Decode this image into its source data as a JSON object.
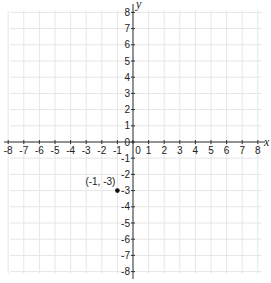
{
  "chart_data": {
    "type": "scatter",
    "title": "",
    "xlabel": "x",
    "ylabel": "y",
    "xlim": [
      -8,
      8
    ],
    "ylim": [
      -8,
      8
    ],
    "grid": true,
    "x_ticks": [
      -8,
      -7,
      -6,
      -5,
      -4,
      -3,
      -2,
      -1,
      0,
      1,
      2,
      3,
      4,
      5,
      6,
      7,
      8
    ],
    "y_ticks": [
      8,
      7,
      6,
      5,
      4,
      3,
      2,
      1,
      0,
      -1,
      -2,
      -3,
      -4,
      -5,
      -6,
      -7,
      -8
    ],
    "points": [
      {
        "x": -1,
        "y": -3,
        "label": "(-1, -3)"
      }
    ],
    "colors": {
      "grid": "#e6e6e6",
      "axis": "#333333",
      "point": "#111111"
    }
  }
}
